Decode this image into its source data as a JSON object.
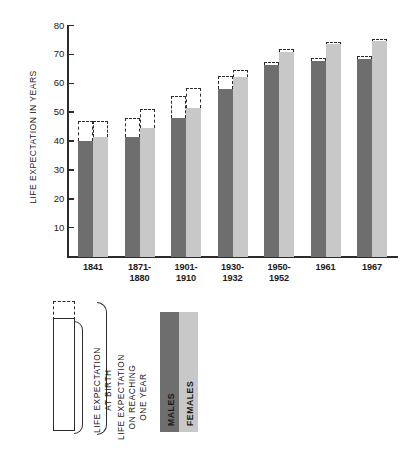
{
  "chart_data": {
    "type": "bar",
    "title": "",
    "subtitle": "",
    "xlabel": "",
    "ylabel": "LIFE EXPECTATION IN YEARS",
    "ylim": [
      0,
      80
    ],
    "yticks": [
      10,
      20,
      30,
      40,
      50,
      60,
      70,
      80
    ],
    "ytick_labels": [
      "10",
      "20",
      "30",
      "40",
      "50",
      "60",
      "70",
      "80"
    ],
    "grid": false,
    "legend_position": "below-plot",
    "categories": [
      "1841",
      "1871-\n1880",
      "1901-\n1910",
      "1930-\n1932",
      "1950-\n1952",
      "1961",
      "1967"
    ],
    "category_labels": [
      {
        "line1": "1841",
        "line2": ""
      },
      {
        "line1": "1871-",
        "line2": "1880"
      },
      {
        "line1": "1901-",
        "line2": "1910"
      },
      {
        "line1": "1930-",
        "line2": "1932"
      },
      {
        "line1": "1950-",
        "line2": "1952"
      },
      {
        "line1": "1961",
        "line2": ""
      },
      {
        "line1": "1967",
        "line2": ""
      }
    ],
    "series": [
      {
        "name": "MALES",
        "color": "#6e6e6e",
        "measure": "LIFE EXPECTATION AT BIRTH",
        "values": [
          40.0,
          41.5,
          48.0,
          58.0,
          66.3,
          67.8,
          68.5
        ]
      },
      {
        "name": "FEMALES",
        "color": "#c8c8c8",
        "measure": "LIFE EXPECTATION AT BIRTH",
        "values": [
          41.5,
          44.5,
          51.5,
          62.0,
          71.0,
          73.5,
          74.5
        ]
      },
      {
        "name": "MALES",
        "color": "#ffffff",
        "measure": "LIFE EXPECTATION ON REACHING ONE YEAR",
        "style": "dashed-outline",
        "values": [
          47.0,
          48.0,
          55.5,
          62.5,
          67.3,
          68.4,
          69.0
        ]
      },
      {
        "name": "FEMALES",
        "color": "#ffffff",
        "measure": "LIFE EXPECTATION ON REACHING ONE YEAR",
        "style": "dashed-outline",
        "values": [
          47.0,
          51.0,
          58.5,
          64.5,
          71.8,
          74.0,
          75.0
        ]
      }
    ]
  },
  "axis": {
    "y_title": "LIFE EXPECTATION IN YEARS",
    "ticks": [
      "80",
      "70",
      "60",
      "50",
      "40",
      "30",
      "20",
      "10"
    ]
  },
  "legend": {
    "at_birth_label": "LIFE EXPECTATION\nAT BIRTH",
    "at_birth_line1": "LIFE EXPECTATION",
    "at_birth_line2": "AT BIRTH",
    "one_year_line1": "LIFE EXPECTATION",
    "one_year_line2": "ON REACHING",
    "one_year_line3": "ONE YEAR",
    "males_label": "MALES",
    "females_label": "FEMALES",
    "males_color": "#6e6e6e",
    "females_color": "#c8c8c8"
  }
}
